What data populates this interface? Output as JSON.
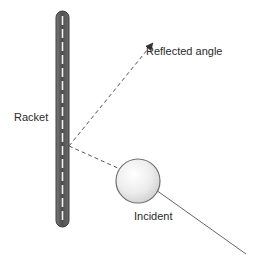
{
  "diagram": {
    "labels": {
      "reflected": "Reflected angle",
      "racket": "Racket",
      "incident": "Incident"
    },
    "colors": {
      "racket_fill": "#5a5a5a",
      "racket_edge": "#3c3c3c",
      "racket_strings": "#f2f2f2",
      "dashed_line": "#555555",
      "incident_line": "#666666",
      "ball_fill": "#f4f4f4",
      "ball_edge": "#707070"
    },
    "elements": {
      "racket": "vertical racket bar",
      "ball": "ball",
      "incident_path": "solid incident trajectory",
      "incident_dashed": "dashed path from ball to racket",
      "reflected_dashed": "dashed reflected path with arrowhead"
    }
  }
}
